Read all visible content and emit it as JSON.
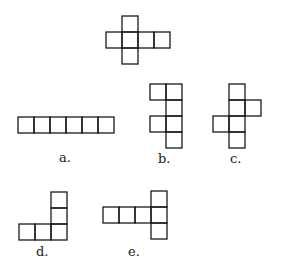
{
  "diagram": {
    "cell_size": 16,
    "stroke_color": "#1a1a1a",
    "stroke_width": 1.3,
    "shapes": [
      {
        "id": "reference",
        "label": "",
        "origin": [
          106,
          16
        ],
        "cells": [
          [
            1,
            0
          ],
          [
            0,
            1
          ],
          [
            1,
            1
          ],
          [
            2,
            1
          ],
          [
            3,
            1
          ],
          [
            1,
            2
          ]
        ]
      },
      {
        "id": "a",
        "label": "a.",
        "label_pos": [
          59,
          151
        ],
        "origin": [
          18,
          117
        ],
        "cells": [
          [
            0,
            0
          ],
          [
            1,
            0
          ],
          [
            2,
            0
          ],
          [
            3,
            0
          ],
          [
            4,
            0
          ],
          [
            5,
            0
          ]
        ]
      },
      {
        "id": "b",
        "label": "b.",
        "label_pos": [
          158,
          152
        ],
        "origin": [
          150,
          84
        ],
        "cells": [
          [
            0,
            0
          ],
          [
            1,
            0
          ],
          [
            1,
            1
          ],
          [
            0,
            2
          ],
          [
            1,
            2
          ],
          [
            1,
            3
          ]
        ]
      },
      {
        "id": "c",
        "label": "c.",
        "label_pos": [
          230,
          152
        ],
        "origin": [
          213,
          84
        ],
        "cells": [
          [
            1,
            0
          ],
          [
            1,
            1
          ],
          [
            2,
            1
          ],
          [
            0,
            2
          ],
          [
            1,
            2
          ],
          [
            1,
            3
          ]
        ]
      },
      {
        "id": "d",
        "label": "d.",
        "label_pos": [
          36,
          245
        ],
        "origin": [
          19,
          192
        ],
        "cells": [
          [
            2,
            0
          ],
          [
            2,
            1
          ],
          [
            0,
            2
          ],
          [
            1,
            2
          ],
          [
            2,
            2
          ]
        ]
      },
      {
        "id": "e",
        "label": "e.",
        "label_pos": [
          128,
          245
        ],
        "origin": [
          103,
          191
        ],
        "cells": [
          [
            3,
            0
          ],
          [
            0,
            1
          ],
          [
            1,
            1
          ],
          [
            2,
            1
          ],
          [
            3,
            1
          ],
          [
            3,
            2
          ]
        ]
      }
    ]
  }
}
